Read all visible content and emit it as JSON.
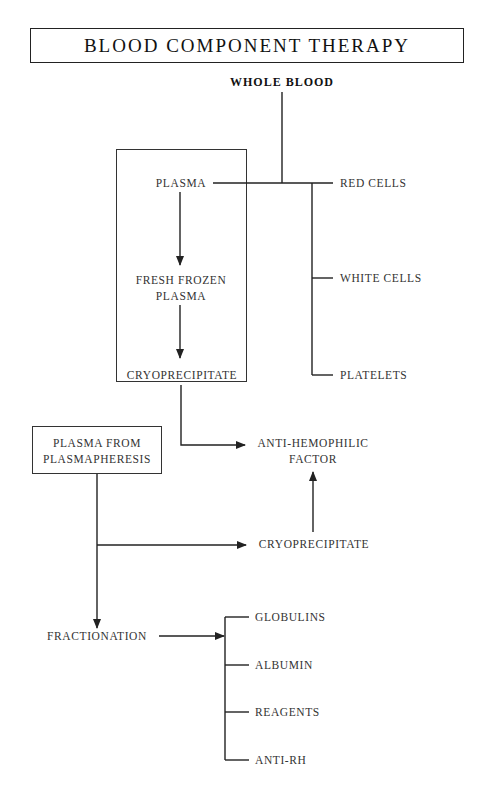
{
  "title": "BLOOD COMPONENT THERAPY",
  "nodes": {
    "whole_blood": "WHOLE BLOOD",
    "plasma": "PLASMA",
    "red_cells": "RED CELLS",
    "white_cells": "WHITE CELLS",
    "platelets": "PLATELETS",
    "ffp_line1": "FRESH FROZEN",
    "ffp_line2": "PLASMA",
    "cryo_top": "CRYOPRECIPITATE",
    "ahf_line1": "ANTI-HEMOPHILIC",
    "ahf_line2": "FACTOR",
    "pp_line1": "PLASMA FROM",
    "pp_line2": "PLASMAPHERESIS",
    "cryo_bottom": "CRYOPRECIPITATE",
    "fractionation": "FRACTIONATION",
    "products": [
      "GLOBULINS",
      "ALBUMIN",
      "REAGENTS",
      "ANTI-RH"
    ]
  },
  "edges": [
    {
      "from": "WHOLE BLOOD",
      "to": "PLASMA"
    },
    {
      "from": "WHOLE BLOOD",
      "to": "RED CELLS"
    },
    {
      "from": "WHOLE BLOOD",
      "to": "WHITE CELLS"
    },
    {
      "from": "WHOLE BLOOD",
      "to": "PLATELETS"
    },
    {
      "from": "PLASMA",
      "to": "FRESH FROZEN PLASMA",
      "arrow": true
    },
    {
      "from": "FRESH FROZEN PLASMA",
      "to": "CRYOPRECIPITATE",
      "arrow": true
    },
    {
      "from": "CRYOPRECIPITATE",
      "to": "ANTI-HEMOPHILIC FACTOR",
      "arrow": true
    },
    {
      "from": "PLASMA FROM PLASMAPHERESIS",
      "to": "CRYOPRECIPITATE",
      "arrow": true
    },
    {
      "from": "CRYOPRECIPITATE",
      "to": "ANTI-HEMOPHILIC FACTOR",
      "arrow": true
    },
    {
      "from": "PLASMA FROM PLASMAPHERESIS",
      "to": "FRACTIONATION",
      "arrow": true
    },
    {
      "from": "FRACTIONATION",
      "to": "GLOBULINS / ALBUMIN / REAGENTS / ANTI-RH",
      "arrow": true
    }
  ]
}
